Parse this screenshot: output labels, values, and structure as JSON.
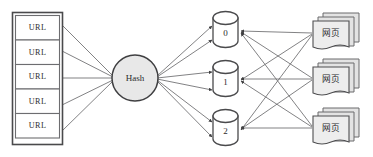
{
  "diagram": {
    "type": "hash-distribution-flow",
    "background_color": "#ffffff",
    "line_color": "#6b6b6e",
    "shape_stroke_color": "#4a4a4c",
    "hash_fill_color": "#e8e8e8",
    "page_fill_color": "#e3e3e3",
    "url_list": {
      "label": "url-queue",
      "items": [
        {
          "label": "URL"
        },
        {
          "label": "URL"
        },
        {
          "label": "URL"
        },
        {
          "label": "URL"
        },
        {
          "label": "URL"
        }
      ]
    },
    "hash_node": {
      "label": "Hash"
    },
    "buckets": [
      {
        "label": "0"
      },
      {
        "label": "1"
      },
      {
        "label": "2"
      }
    ],
    "page_stacks": [
      {
        "label": "网页",
        "count": 3
      },
      {
        "label": "网页",
        "count": 3
      },
      {
        "label": "网页",
        "count": 3
      }
    ]
  }
}
